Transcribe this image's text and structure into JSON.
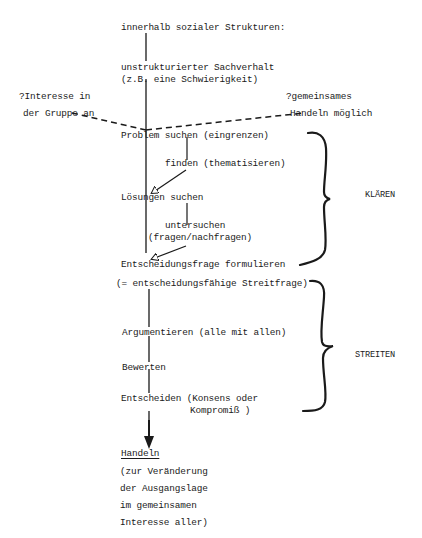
{
  "diagram": {
    "top": {
      "context": "innerhalb sozialer Strukturen:",
      "situation_line1": "unstrukturierter Sachverhalt",
      "situation_line2": "(z.B. eine Schwierigkeit)"
    },
    "preconditions": {
      "left_line1": "?Interesse in",
      "left_line2": "der Gruppe an",
      "right_line1": "?gemeinsames",
      "right_line2": "Handeln möglich"
    },
    "steps": {
      "problem": "Problem suchen (eingrenzen)",
      "finden": "finden (thematisieren)",
      "loesungen": "Lösungen suchen",
      "untersuchen_line1": "untersuchen",
      "untersuchen_line2": "(fragen/nachfragen)",
      "entscheidungsfrage": "Entscheidungsfrage formulieren",
      "streitfrage": "(= entscheidungsfähige Streitfrage)",
      "argumentieren": "Argumentieren (alle mit allen)",
      "bewerten": "Bewerten",
      "entscheiden_line1": "Entscheiden (Konsens oder",
      "entscheiden_line2": "Kompromiß )"
    },
    "phases": {
      "klaeren": "KLÄREN",
      "streiten": "STREITEN"
    },
    "result": {
      "title": "Handeln",
      "line1": "(zur Veränderung",
      "line2": "der Ausgangslage",
      "line3": "im gemeinsamen",
      "line4": "Interesse aller)"
    }
  }
}
